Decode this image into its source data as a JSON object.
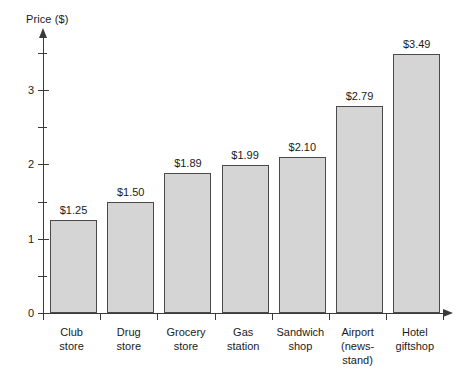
{
  "chart_data": {
    "type": "bar",
    "title": "",
    "ylabel": "Price ($)",
    "xlabel": "",
    "categories": [
      "Club store",
      "Drug store",
      "Grocery store",
      "Gas station",
      "Sandwich shop",
      "Airport (news-stand)",
      "Hotel giftshop"
    ],
    "category_lines": [
      [
        "Club",
        "store"
      ],
      [
        "Drug",
        "store"
      ],
      [
        "Grocery",
        "store"
      ],
      [
        "Gas",
        "station"
      ],
      [
        "Sandwich",
        "shop"
      ],
      [
        "Airport",
        "(news-",
        "stand)"
      ],
      [
        "Hotel",
        "giftshop"
      ]
    ],
    "values": [
      1.25,
      1.5,
      1.89,
      1.99,
      2.1,
      2.79,
      3.49
    ],
    "value_labels": [
      "$1.25",
      "$1.50",
      "$1.89",
      "$1.99",
      "$2.10",
      "$2.79",
      "$3.49"
    ],
    "ylim": [
      0,
      3.75
    ],
    "ytick_labels": [
      "0",
      "1",
      "2",
      "3"
    ],
    "ytick_values": [
      0,
      1,
      2,
      3
    ],
    "yminor_values": [
      0.5,
      1.5,
      2.5,
      3.5
    ],
    "grid": false,
    "legend": null,
    "bar_fill_color": "#d5d5d5",
    "bar_border_color": "#4a4a4a",
    "axis_color": "#3a3a3a"
  }
}
